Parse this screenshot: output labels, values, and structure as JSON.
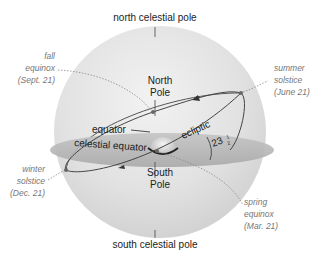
{
  "diagram": {
    "type": "celestial-sphere",
    "labels": {
      "north_celestial_pole": "north celestial pole",
      "south_celestial_pole": "south celestial pole",
      "north_pole": [
        "North",
        "Pole"
      ],
      "south_pole": [
        "South",
        "Pole"
      ],
      "equator": "equator",
      "celestial_equator": "celestial equator",
      "ecliptic": "ecliptic",
      "tilt_angle": {
        "whole": "23",
        "num": "1",
        "den": "2"
      }
    },
    "events": [
      {
        "id": "fall-equinox",
        "lines": [
          "fall",
          "equinox",
          "(Sept. 21)"
        ]
      },
      {
        "id": "summer-solstice",
        "lines": [
          "summer",
          "solstice",
          "(June 21)"
        ]
      },
      {
        "id": "winter-solstice",
        "lines": [
          "winter",
          "solstice",
          "(Dec. 21)"
        ]
      },
      {
        "id": "spring-equinox",
        "lines": [
          "spring",
          "equinox",
          "(Mar. 21)"
        ]
      }
    ],
    "colors": {
      "sphere_light": "#ececec",
      "sphere_dark": "#c8c8c8",
      "equator_plane": "#b9b9b9",
      "ecliptic_line": "#444444",
      "italic_text": "#777777"
    }
  }
}
